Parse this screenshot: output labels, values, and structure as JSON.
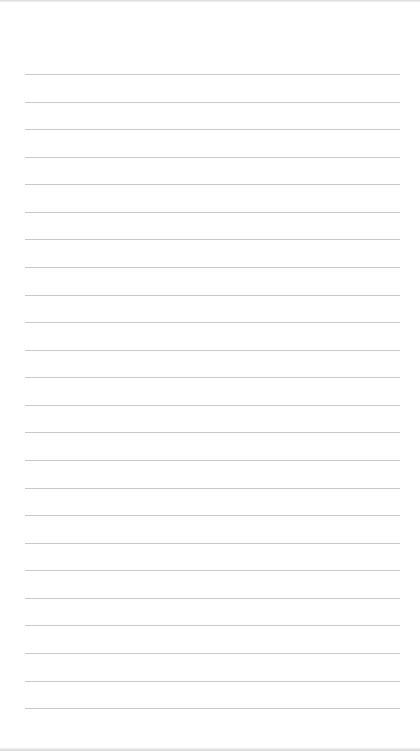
{
  "page": {
    "type": "lined-notepad",
    "background": "#ffffff",
    "line_color": "#c9c9c9",
    "line_count": 24,
    "line_start_y": 74,
    "line_spacing": 27.57,
    "line_left": 25,
    "line_width": 375
  }
}
